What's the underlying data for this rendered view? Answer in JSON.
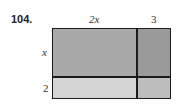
{
  "problem": {
    "number": "104.",
    "labels": {
      "top_left": "2x",
      "top_right": "3",
      "left_top": "x",
      "left_bottom": "2"
    },
    "regions": [
      {
        "name": "2x-by-x",
        "color": "#a9a9a9"
      },
      {
        "name": "3-by-x",
        "color": "#9a9a9a"
      },
      {
        "name": "2x-by-2",
        "color": "#d6d6d6"
      },
      {
        "name": "3-by-2",
        "color": "#bdbdbd"
      }
    ]
  }
}
